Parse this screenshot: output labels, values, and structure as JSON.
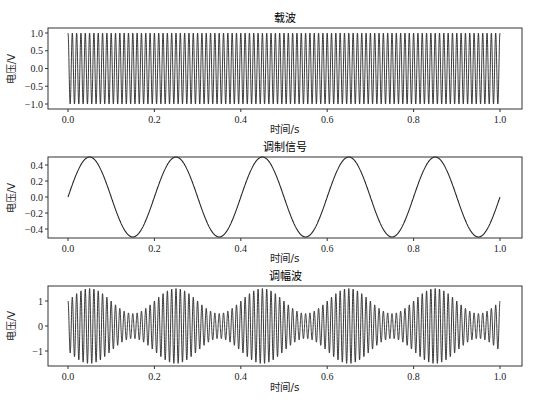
{
  "chart_data": [
    {
      "type": "line",
      "title": "载波",
      "xlabel": "时间/s",
      "ylabel": "电压/V",
      "xlim": [
        -0.045,
        1.05
      ],
      "ylim": [
        -1.1,
        1.1
      ],
      "xticks": [
        0.0,
        0.2,
        0.4,
        0.6,
        0.8,
        1.0
      ],
      "xtick_labels": [
        "0.0",
        "0.2",
        "0.4",
        "0.6",
        "0.8",
        "1.0"
      ],
      "yticks": [
        1.0,
        0.5,
        0.0,
        -0.5,
        -1.0
      ],
      "ytick_labels": [
        "1.0",
        "0.5",
        "0.0",
        "−0.5",
        "−1.0"
      ],
      "grid": false,
      "series": [
        {
          "name": "carrier",
          "formula": "cos(2*pi*100*t)",
          "amplitude": 1.0,
          "frequency_hz": 100,
          "x_range": [
            0,
            1
          ]
        }
      ]
    },
    {
      "type": "line",
      "title": "调制信号",
      "xlabel": "时间/s",
      "ylabel": "电压/V",
      "xlim": [
        -0.045,
        1.05
      ],
      "ylim": [
        -0.5,
        0.5
      ],
      "xticks": [
        0.0,
        0.2,
        0.4,
        0.6,
        0.8,
        1.0
      ],
      "xtick_labels": [
        "0.0",
        "0.2",
        "0.4",
        "0.6",
        "0.8",
        "1.0"
      ],
      "yticks": [
        0.4,
        0.2,
        0.0,
        -0.2,
        -0.4
      ],
      "ytick_labels": [
        "0.4",
        "0.2",
        "0.0",
        "−0.2",
        "−0.4"
      ],
      "grid": false,
      "series": [
        {
          "name": "modulating signal",
          "formula": "0.5*sin(2*pi*5*t)",
          "amplitude": 0.5,
          "frequency_hz": 5,
          "x_range": [
            0,
            1
          ]
        }
      ]
    },
    {
      "type": "line",
      "title": "调幅波",
      "xlabel": "时间/s",
      "ylabel": "电压/V",
      "xlim": [
        -0.045,
        1.05
      ],
      "ylim": [
        -1.6,
        1.6
      ],
      "xticks": [
        0.0,
        0.2,
        0.4,
        0.6,
        0.8,
        1.0
      ],
      "xtick_labels": [
        "0.0",
        "0.2",
        "0.4",
        "0.6",
        "0.8",
        "1.0"
      ],
      "yticks": [
        1,
        0,
        -1
      ],
      "ytick_labels": [
        "1",
        "0",
        "−1"
      ],
      "grid": false,
      "series": [
        {
          "name": "AM wave",
          "formula": "(1+0.5*sin(2*pi*5*t))*cos(2*pi*100*t)",
          "envelope_max": 1.5,
          "envelope_min": 0.5,
          "carrier_hz": 100,
          "modulation_hz": 5,
          "x_range": [
            0,
            1
          ]
        }
      ]
    }
  ]
}
